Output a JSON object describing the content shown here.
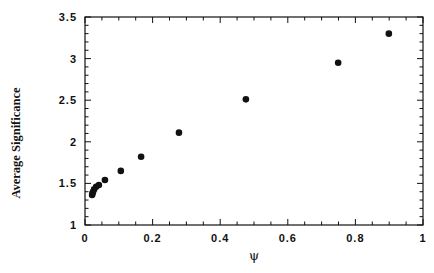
{
  "chart_data": {
    "type": "scatter",
    "title": "",
    "xlabel": "ψ",
    "ylabel": "Average Significance",
    "xlim": [
      0,
      1
    ],
    "ylim": [
      1,
      3.5
    ],
    "grid": false,
    "legend": null,
    "x_ticks": [
      0,
      0.2,
      0.4,
      0.6,
      0.8,
      1
    ],
    "x_tick_labels": [
      "0",
      "0.2",
      "0.4",
      "0.6",
      "0.8",
      "1"
    ],
    "y_ticks": [
      1,
      1.5,
      2,
      2.5,
      3,
      3.5
    ],
    "y_tick_labels": [
      "1",
      "1.5",
      "2",
      "2.5",
      "3",
      "3.5"
    ],
    "x_minor_step": 0.05,
    "y_minor_step": 0.1,
    "series": [
      {
        "name": "Average Significance vs ψ",
        "marker": "filled-circle",
        "color": "#111111",
        "points": [
          {
            "x": 0.021,
            "y": 1.36
          },
          {
            "x": 0.022,
            "y": 1.38
          },
          {
            "x": 0.024,
            "y": 1.4
          },
          {
            "x": 0.027,
            "y": 1.43
          },
          {
            "x": 0.033,
            "y": 1.46
          },
          {
            "x": 0.041,
            "y": 1.48
          },
          {
            "x": 0.059,
            "y": 1.54
          },
          {
            "x": 0.106,
            "y": 1.65
          },
          {
            "x": 0.166,
            "y": 1.82
          },
          {
            "x": 0.278,
            "y": 2.11
          },
          {
            "x": 0.476,
            "y": 2.51
          },
          {
            "x": 0.749,
            "y": 2.95
          },
          {
            "x": 0.899,
            "y": 3.3
          }
        ]
      }
    ]
  },
  "layout": {
    "plot_left": 85,
    "plot_right": 423,
    "plot_top": 17,
    "plot_bottom": 225,
    "axis_color": "#111111",
    "marker_radius": 3.3
  }
}
